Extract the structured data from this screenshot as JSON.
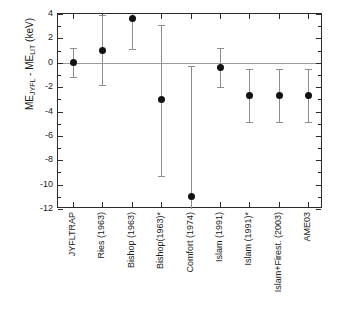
{
  "chart_data": {
    "type": "scatter",
    "title": "",
    "xlabel": "",
    "ylabel": "ME_JYFL - ME_LIT (keV)",
    "ylabel_parts": {
      "prefix": "ME",
      "sub1": "JYFL",
      "middle": " - ME",
      "sub2": "LIT",
      "suffix": " (keV)"
    },
    "ylim": [
      -12,
      4
    ],
    "yticks": [
      4,
      2,
      0,
      -2,
      -4,
      -6,
      -8,
      -10,
      -12
    ],
    "ytick_labels": [
      "4",
      "2",
      "0",
      "-2",
      "-4",
      "-6",
      "-8",
      "-10",
      "-12"
    ],
    "y_minor_tick_step": 1,
    "grid": false,
    "legend": "none",
    "zero_reference_line": 0,
    "categories": [
      "JYFLTRAP",
      "Ries (1963)",
      "Bishop (1963)",
      "Bishop(1963)*",
      "Comfort (1974)",
      "Islam (1991)",
      "Islam (1991)*",
      "Islam+Firest. (2003)",
      "AME03"
    ],
    "values": [
      0.0,
      1.0,
      3.6,
      -3.0,
      -11.0,
      -0.4,
      -2.7,
      -2.7,
      -2.7
    ],
    "err_upper": [
      1.2,
      2.9,
      0.4,
      6.1,
      10.7,
      1.6,
      2.2,
      2.2,
      2.2
    ],
    "err_lower": [
      1.2,
      2.9,
      2.5,
      6.3,
      1.0,
      1.6,
      2.2,
      2.2,
      2.2
    ],
    "points": [
      {
        "category": "JYFLTRAP",
        "value": 0.0,
        "high": 1.2,
        "low": -1.2
      },
      {
        "category": "Ries (1963)",
        "value": 1.0,
        "high": 3.9,
        "low": -1.8
      },
      {
        "category": "Bishop (1963)",
        "value": 3.6,
        "high": 4.0,
        "low": 1.1
      },
      {
        "category": "Bishop(1963)*",
        "value": -3.0,
        "high": 3.1,
        "low": -9.3
      },
      {
        "category": "Comfort (1974)",
        "value": -11.0,
        "high": -0.3,
        "low": -12.0
      },
      {
        "category": "Islam (1991)",
        "value": -0.4,
        "high": 1.2,
        "low": -2.0
      },
      {
        "category": "Islam (1991)*",
        "value": -2.7,
        "high": -0.5,
        "low": -4.9
      },
      {
        "category": "Islam+Firest. (2003)",
        "value": -2.7,
        "high": -0.5,
        "low": -4.9
      },
      {
        "category": "AME03",
        "value": -2.7,
        "high": -0.5,
        "low": -4.9
      }
    ],
    "colors": {
      "marker": "#111111",
      "errorbar": "#8d8d8d",
      "axis": "#2b2b2b",
      "zero_line": "#9b9b9b",
      "background": "#ffffff"
    }
  }
}
